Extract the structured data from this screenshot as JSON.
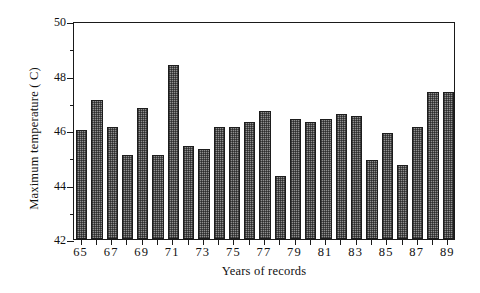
{
  "chart_data": {
    "type": "bar",
    "title": "",
    "subtitle": "",
    "xlabel": "Years of records",
    "ylabel": "Maximum temperature ( C)",
    "ylim": [
      42,
      50
    ],
    "ytick_values": [
      42,
      44,
      46,
      48,
      50
    ],
    "ytick_labels": [
      "42",
      "44",
      "46",
      "48",
      "50"
    ],
    "yminor_tick_values": [
      43,
      45,
      47,
      49
    ],
    "grid": false,
    "legend": null,
    "legend_position": "none",
    "bar_style": "crosshatch-gray",
    "categories": [
      "65",
      "66",
      "67",
      "68",
      "69",
      "70",
      "71",
      "72",
      "73",
      "74",
      "75",
      "76",
      "77",
      "78",
      "79",
      "80",
      "81",
      "82",
      "83",
      "84",
      "85",
      "86",
      "87",
      "88",
      "89"
    ],
    "xtick_labels": [
      "65",
      "67",
      "69",
      "71",
      "73",
      "75",
      "77",
      "79",
      "81",
      "83",
      "85",
      "87",
      "89"
    ],
    "values": [
      46.0,
      47.1,
      46.1,
      45.1,
      46.8,
      45.1,
      48.4,
      45.4,
      45.3,
      46.1,
      46.1,
      46.3,
      46.7,
      44.3,
      46.4,
      46.3,
      46.4,
      46.6,
      46.5,
      44.9,
      45.9,
      44.7,
      46.1,
      47.4,
      47.4
    ],
    "series": [
      {
        "name": "Maximum temperature",
        "values": [
          46.0,
          47.1,
          46.1,
          45.1,
          46.8,
          45.1,
          48.4,
          45.4,
          45.3,
          46.1,
          46.1,
          46.3,
          46.7,
          44.3,
          46.4,
          46.3,
          46.4,
          46.6,
          46.5,
          44.9,
          45.9,
          44.7,
          46.1,
          47.4,
          47.4
        ]
      }
    ]
  },
  "colors": {
    "axis": "#1a1a1a",
    "bar_fill": "#8f8f8f",
    "bar_edge": "#1d1d1d",
    "background": "#ffffff"
  }
}
